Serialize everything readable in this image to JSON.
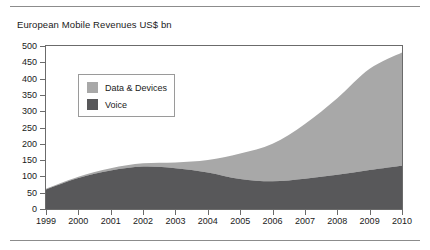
{
  "chart_data": {
    "type": "area",
    "stacked": true,
    "title": "European Mobile Revenues US$ bn",
    "xlabel": "",
    "ylabel": "",
    "ylim": [
      0,
      500
    ],
    "ytick_step": 50,
    "grid": false,
    "legend_position": "inside-upper-left",
    "x": [
      "1999",
      "2000",
      "2001",
      "2002",
      "2003",
      "2004",
      "2005",
      "2006",
      "2007",
      "2008",
      "2009",
      "2010"
    ],
    "categories": [
      "1999",
      "2000",
      "2001",
      "2002",
      "2003",
      "2004",
      "2005",
      "2006",
      "2007",
      "2008",
      "2009",
      "2010"
    ],
    "yticks": [
      "0",
      "50",
      "100",
      "150",
      "200",
      "250",
      "300",
      "350",
      "400",
      "450",
      "500"
    ],
    "series": [
      {
        "name": "Voice",
        "color": "#58585a",
        "values": [
          60,
          95,
          118,
          130,
          125,
          112,
          92,
          85,
          93,
          105,
          120,
          133
        ]
      },
      {
        "name": "Data & Devices",
        "color": "#a8a8a8",
        "values": [
          2,
          4,
          7,
          10,
          18,
          38,
          78,
          115,
          168,
          235,
          310,
          347
        ]
      }
    ],
    "totals": [
      62,
      99,
      125,
      140,
      143,
      150,
      170,
      200,
      261,
      340,
      430,
      480
    ]
  },
  "legend": {
    "items": [
      {
        "label": "Data & Devices",
        "color": "#a8a8a8"
      },
      {
        "label": "Voice",
        "color": "#58585a"
      }
    ]
  }
}
